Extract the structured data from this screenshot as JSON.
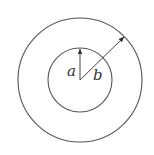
{
  "diagram": {
    "center": [
      80,
      80
    ],
    "outer_radius": 62,
    "inner_radius": 32,
    "stroke_color": "#555555",
    "labels": {
      "inner": "a",
      "outer": "b"
    }
  }
}
